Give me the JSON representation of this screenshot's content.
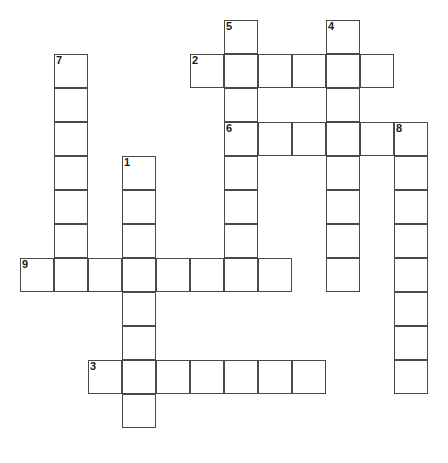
{
  "puzzle": {
    "type": "crossword-grid",
    "title": "",
    "grid_origin": {
      "x": 20,
      "y": 20
    },
    "cell_size": 34,
    "columns": 13,
    "rows": 13,
    "line_color": "#4a4a4a",
    "cell_fill": "#ffffff",
    "background": "#ffffff",
    "entries": [
      {
        "number": "1",
        "direction": "down",
        "length": 8,
        "start_col": 3,
        "start_row": 4,
        "cells": [
          {
            "col": 3,
            "row": 4
          },
          {
            "col": 3,
            "row": 5
          },
          {
            "col": 3,
            "row": 6
          },
          {
            "col": 3,
            "row": 7
          },
          {
            "col": 3,
            "row": 8
          },
          {
            "col": 3,
            "row": 9
          },
          {
            "col": 3,
            "row": 10
          },
          {
            "col": 3,
            "row": 11
          }
        ]
      },
      {
        "number": "2",
        "direction": "across",
        "length": 6,
        "start_col": 5,
        "start_row": 1,
        "cells": [
          {
            "col": 5,
            "row": 1
          },
          {
            "col": 6,
            "row": 1
          },
          {
            "col": 7,
            "row": 1
          },
          {
            "col": 8,
            "row": 1
          },
          {
            "col": 9,
            "row": 1
          },
          {
            "col": 10,
            "row": 1
          }
        ]
      },
      {
        "number": "3",
        "direction": "across",
        "length": 7,
        "start_col": 2,
        "start_row": 10,
        "cells": [
          {
            "col": 2,
            "row": 10
          },
          {
            "col": 3,
            "row": 10
          },
          {
            "col": 4,
            "row": 10
          },
          {
            "col": 5,
            "row": 10
          },
          {
            "col": 6,
            "row": 10
          },
          {
            "col": 7,
            "row": 10
          },
          {
            "col": 8,
            "row": 10
          }
        ]
      },
      {
        "number": "4",
        "direction": "down",
        "length": 8,
        "start_col": 9,
        "start_row": 0,
        "cells": [
          {
            "col": 9,
            "row": 0
          },
          {
            "col": 9,
            "row": 1
          },
          {
            "col": 9,
            "row": 2
          },
          {
            "col": 9,
            "row": 3
          },
          {
            "col": 9,
            "row": 4
          },
          {
            "col": 9,
            "row": 5
          },
          {
            "col": 9,
            "row": 6
          },
          {
            "col": 9,
            "row": 7
          }
        ]
      },
      {
        "number": "5",
        "direction": "down",
        "length": 8,
        "start_col": 6,
        "start_row": 0,
        "cells": [
          {
            "col": 6,
            "row": 0
          },
          {
            "col": 6,
            "row": 1
          },
          {
            "col": 6,
            "row": 2
          },
          {
            "col": 6,
            "row": 3
          },
          {
            "col": 6,
            "row": 4
          },
          {
            "col": 6,
            "row": 5
          },
          {
            "col": 6,
            "row": 6
          },
          {
            "col": 6,
            "row": 7
          }
        ]
      },
      {
        "number": "6",
        "direction": "across",
        "length": 6,
        "start_col": 6,
        "start_row": 3,
        "cells": [
          {
            "col": 6,
            "row": 3
          },
          {
            "col": 7,
            "row": 3
          },
          {
            "col": 8,
            "row": 3
          },
          {
            "col": 9,
            "row": 3
          },
          {
            "col": 10,
            "row": 3
          },
          {
            "col": 11,
            "row": 3
          }
        ]
      },
      {
        "number": "7",
        "direction": "down",
        "length": 7,
        "start_col": 1,
        "start_row": 1,
        "cells": [
          {
            "col": 1,
            "row": 1
          },
          {
            "col": 1,
            "row": 2
          },
          {
            "col": 1,
            "row": 3
          },
          {
            "col": 1,
            "row": 4
          },
          {
            "col": 1,
            "row": 5
          },
          {
            "col": 1,
            "row": 6
          },
          {
            "col": 1,
            "row": 7
          }
        ]
      },
      {
        "number": "8",
        "direction": "down",
        "length": 8,
        "start_col": 11,
        "start_row": 3,
        "cells": [
          {
            "col": 11,
            "row": 3
          },
          {
            "col": 11,
            "row": 4
          },
          {
            "col": 11,
            "row": 5
          },
          {
            "col": 11,
            "row": 6
          },
          {
            "col": 11,
            "row": 7
          },
          {
            "col": 11,
            "row": 8
          },
          {
            "col": 11,
            "row": 9
          },
          {
            "col": 11,
            "row": 10
          }
        ]
      },
      {
        "number": "9",
        "direction": "across",
        "length": 8,
        "start_col": 0,
        "start_row": 7,
        "cells": [
          {
            "col": 0,
            "row": 7
          },
          {
            "col": 1,
            "row": 7
          },
          {
            "col": 2,
            "row": 7
          },
          {
            "col": 3,
            "row": 7
          },
          {
            "col": 4,
            "row": 7
          },
          {
            "col": 5,
            "row": 7
          },
          {
            "col": 6,
            "row": 7
          },
          {
            "col": 7,
            "row": 7
          }
        ]
      }
    ],
    "clue_numbers": [
      {
        "label": "1",
        "col": 3,
        "row": 4
      },
      {
        "label": "2",
        "col": 5,
        "row": 1
      },
      {
        "label": "3",
        "col": 2,
        "row": 10
      },
      {
        "label": "4",
        "col": 9,
        "row": 0
      },
      {
        "label": "5",
        "col": 6,
        "row": 0
      },
      {
        "label": "6",
        "col": 6,
        "row": 3
      },
      {
        "label": "7",
        "col": 1,
        "row": 1
      },
      {
        "label": "8",
        "col": 11,
        "row": 3
      },
      {
        "label": "9",
        "col": 0,
        "row": 7
      }
    ]
  }
}
